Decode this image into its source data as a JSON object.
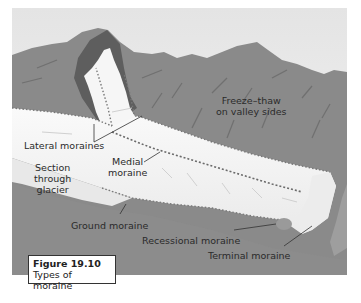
{
  "figure": {
    "number": "Figure 19.10",
    "title": "Types of moraine"
  },
  "labels": {
    "freeze_thaw_line1": "Freeze–thaw",
    "freeze_thaw_line2": "on valley sides",
    "lateral_moraines": "Lateral moraines",
    "medial_moraine_line1": "Medial",
    "medial_moraine_line2": "moraine",
    "section_line1": "Section",
    "section_line2": "through",
    "section_line3": "glacier",
    "ground_moraine": "Ground moraine",
    "recessional_moraine": "Recessional moraine",
    "terminal_moraine": "Terminal moraine"
  },
  "colors": {
    "sky_top": "#e6e6e6",
    "sky_bottom": "#f4f4f4",
    "mountain": "#8a8a8a",
    "mountain_dark": "#6e6e6e",
    "cirque_shadow": "#5c5c5c",
    "ice": "#f7f7f7",
    "ice_shade": "#e2e2e2",
    "valley_floor": "#8c8c8c",
    "moraine_debris": "#9a9a9a",
    "leader_line": "#333333"
  }
}
